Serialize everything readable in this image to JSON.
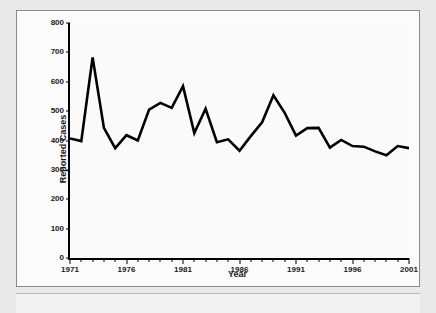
{
  "chart_data": {
    "type": "line",
    "title": "",
    "xlabel": "Year",
    "ylabel": "Reported Cases",
    "xlim": [
      1971,
      2001
    ],
    "ylim": [
      0,
      800
    ],
    "ytick_step": 100,
    "xtick_step": 1,
    "xtick_label_step": 5,
    "grid": false,
    "legend": null,
    "line_color": "#000000",
    "x": [
      1971,
      1972,
      1973,
      1974,
      1975,
      1976,
      1977,
      1978,
      1979,
      1980,
      1981,
      1982,
      1983,
      1984,
      1985,
      1986,
      1987,
      1988,
      1989,
      1990,
      1991,
      1992,
      1993,
      1994,
      1995,
      1996,
      1997,
      1998,
      1999,
      2000,
      2001
    ],
    "values": [
      407,
      398,
      683,
      443,
      374,
      418,
      400,
      505,
      528,
      511,
      585,
      425,
      508,
      394,
      404,
      365,
      415,
      462,
      554,
      494,
      417,
      442,
      443,
      376,
      402,
      381,
      379,
      363,
      350,
      381,
      374
    ],
    "ytick_labels": [
      "0",
      "100",
      "200",
      "300",
      "400",
      "500",
      "600",
      "700",
      "800"
    ],
    "xtick_labels": [
      "1971",
      "1976",
      "1981",
      "1986",
      "1991",
      "1996",
      "2001"
    ]
  },
  "axes": {
    "y_title": "Reported Cases",
    "x_title": "Year"
  }
}
